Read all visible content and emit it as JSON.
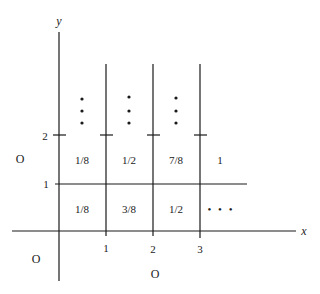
{
  "diagram": {
    "axes": {
      "x_label": "x",
      "y_label": "y",
      "x_ticks": [
        "1",
        "2",
        "3"
      ],
      "y_ticks": [
        "1",
        "2"
      ]
    },
    "cells": {
      "row_1_to_2": [
        "1/8",
        "1/2",
        "7/8",
        "1"
      ],
      "row_0_to_1": [
        "1/8",
        "3/8",
        "1/2",
        "• • •"
      ]
    },
    "region_labels": {
      "left": "O",
      "bottom_left": "O",
      "bottom": "O"
    },
    "continuation": "vertical-dots",
    "colors": {
      "line": "#1a1a1a",
      "background": "#ffffff"
    }
  }
}
